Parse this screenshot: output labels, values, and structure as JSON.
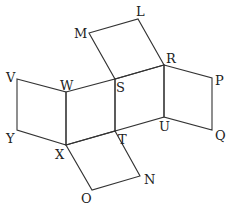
{
  "diagram": {
    "type": "net-of-solid",
    "vertices": {
      "M": [
        89,
        33
      ],
      "L": [
        138,
        19
      ],
      "R": [
        164,
        65
      ],
      "S": [
        115,
        79
      ],
      "V": [
        17,
        79
      ],
      "W": [
        66,
        92
      ],
      "X": [
        66,
        145
      ],
      "Y": [
        17,
        130
      ],
      "T": [
        115,
        131
      ],
      "U": [
        164,
        117
      ],
      "P": [
        212,
        78
      ],
      "Q": [
        212,
        130
      ],
      "O": [
        92,
        190
      ],
      "N": [
        140,
        176
      ]
    },
    "faces": [
      [
        "M",
        "L",
        "R",
        "S"
      ],
      [
        "V",
        "W",
        "X",
        "Y"
      ],
      [
        "W",
        "S",
        "T",
        "X"
      ],
      [
        "S",
        "R",
        "U",
        "T"
      ],
      [
        "R",
        "P",
        "Q",
        "U"
      ],
      [
        "X",
        "T",
        "N",
        "O"
      ]
    ],
    "labels": {
      "M": "M",
      "L": "L",
      "R": "R",
      "S": "S",
      "V": "V",
      "W": "W",
      "X": "X",
      "Y": "Y",
      "T": "T",
      "U": "U",
      "P": "P",
      "Q": "Q",
      "O": "O",
      "N": "N"
    }
  }
}
